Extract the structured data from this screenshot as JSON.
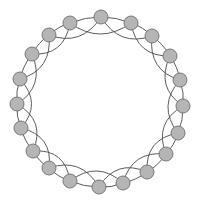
{
  "diagram": {
    "type": "ring-lattice-graph",
    "node_count": 20,
    "neighbors_per_side": 2,
    "colors": {
      "node_fill": "#b5b5b5",
      "node_stroke": "#6e6e6e",
      "edge": "#4a4a4a",
      "background": "#ffffff"
    },
    "node_radius": 7,
    "center": [
      100,
      104
    ],
    "nodes": [
      {
        "id": 0,
        "x": 101,
        "y": 17
      },
      {
        "id": 1,
        "x": 131,
        "y": 23
      },
      {
        "id": 2,
        "x": 152,
        "y": 36
      },
      {
        "id": 3,
        "x": 170,
        "y": 56
      },
      {
        "id": 4,
        "x": 180,
        "y": 80
      },
      {
        "id": 5,
        "x": 183,
        "y": 106
      },
      {
        "id": 6,
        "x": 178,
        "y": 133
      },
      {
        "id": 7,
        "x": 166,
        "y": 154
      },
      {
        "id": 8,
        "x": 147,
        "y": 172
      },
      {
        "id": 9,
        "x": 123,
        "y": 183
      },
      {
        "id": 10,
        "x": 99,
        "y": 187
      },
      {
        "id": 11,
        "x": 70,
        "y": 181
      },
      {
        "id": 12,
        "x": 49,
        "y": 168
      },
      {
        "id": 13,
        "x": 33,
        "y": 151
      },
      {
        "id": 14,
        "x": 21,
        "y": 128
      },
      {
        "id": 15,
        "x": 17,
        "y": 104
      },
      {
        "id": 16,
        "x": 20,
        "y": 79
      },
      {
        "id": 17,
        "x": 32,
        "y": 54
      },
      {
        "id": 18,
        "x": 49,
        "y": 35
      },
      {
        "id": 19,
        "x": 70,
        "y": 23
      }
    ]
  }
}
